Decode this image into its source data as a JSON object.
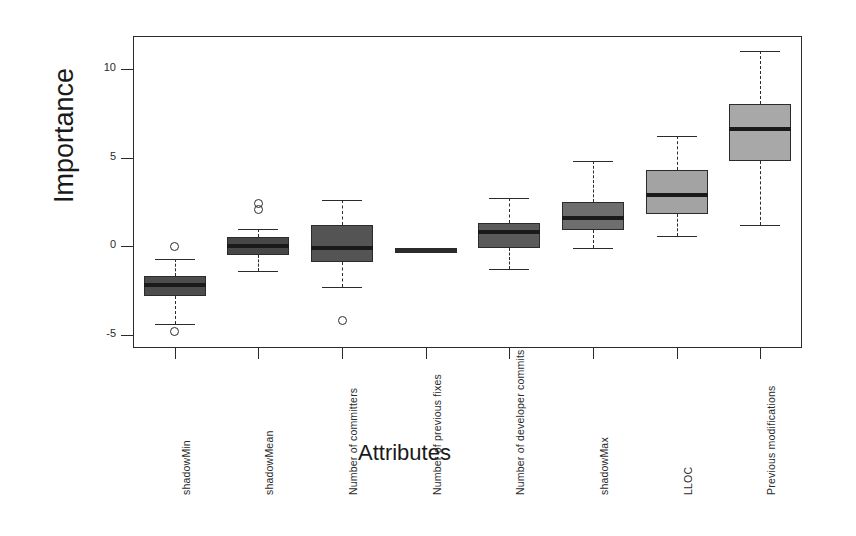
{
  "axes": {
    "ylabel": "Importance",
    "xlabel": "Attributes",
    "y_ticks": [
      "10",
      "5",
      "0",
      "-5"
    ],
    "y_tick_values": [
      10,
      5,
      0,
      -5
    ]
  },
  "chart_data": {
    "type": "box",
    "title": "",
    "xlabel": "Attributes",
    "ylabel": "Importance",
    "ylim": [
      -6.5,
      11.8
    ],
    "grid": false,
    "legend": "none",
    "categories": [
      "shadowMin",
      "shadowMean",
      "Number of committers",
      "Number of previous fixes",
      "Number of developer commits",
      "shadowMax",
      "LLOC",
      "Previous modifications"
    ],
    "boxes": [
      {
        "name": "shadowMin",
        "whisker_low": -4.4,
        "q1": -2.8,
        "median": -2.2,
        "q3": -1.7,
        "whisker_high": -0.7,
        "outliers": [
          0.0,
          -4.8
        ],
        "fill": "#4d4d4d"
      },
      {
        "name": "shadowMean",
        "whisker_low": -1.4,
        "q1": -0.5,
        "median": 0.0,
        "q3": 0.5,
        "whisker_high": 1.0,
        "outliers": [
          2.4,
          2.1
        ],
        "fill": "#474747"
      },
      {
        "name": "Number of committers",
        "whisker_low": -2.3,
        "q1": -0.9,
        "median": -0.1,
        "q3": 1.2,
        "whisker_high": 2.6,
        "outliers": [
          -4.2
        ],
        "fill": "#545454"
      },
      {
        "name": "Number of previous fixes",
        "whisker_low": -0.1,
        "q1": -0.1,
        "median": -0.1,
        "q3": -0.1,
        "whisker_high": -0.1,
        "outliers": [],
        "fill": "#2b2b2b"
      },
      {
        "name": "Number of developer commits",
        "whisker_low": -1.3,
        "q1": -0.1,
        "median": 0.8,
        "q3": 1.3,
        "whisker_high": 2.7,
        "outliers": [],
        "fill": "#5a5a5a"
      },
      {
        "name": "shadowMax",
        "whisker_low": -0.1,
        "q1": 0.9,
        "median": 1.6,
        "q3": 2.5,
        "whisker_high": 4.8,
        "outliers": [],
        "fill": "#6e6e6e"
      },
      {
        "name": "LLOC",
        "whisker_low": 0.6,
        "q1": 1.8,
        "median": 2.9,
        "q3": 4.3,
        "whisker_high": 6.2,
        "outliers": [],
        "fill": "#a3a3a3"
      },
      {
        "name": "Previous modifications",
        "whisker_low": 1.2,
        "q1": 4.8,
        "median": 6.6,
        "q3": 8.0,
        "whisker_high": 11.0,
        "outliers": [],
        "fill": "#a8a8a8"
      }
    ]
  },
  "colors": {
    "axis": "#2b2b2b",
    "text": "#1a1a1a",
    "background": "#ffffff",
    "dark_box": "#4d4d4d",
    "light_box": "#a5a5a5"
  }
}
